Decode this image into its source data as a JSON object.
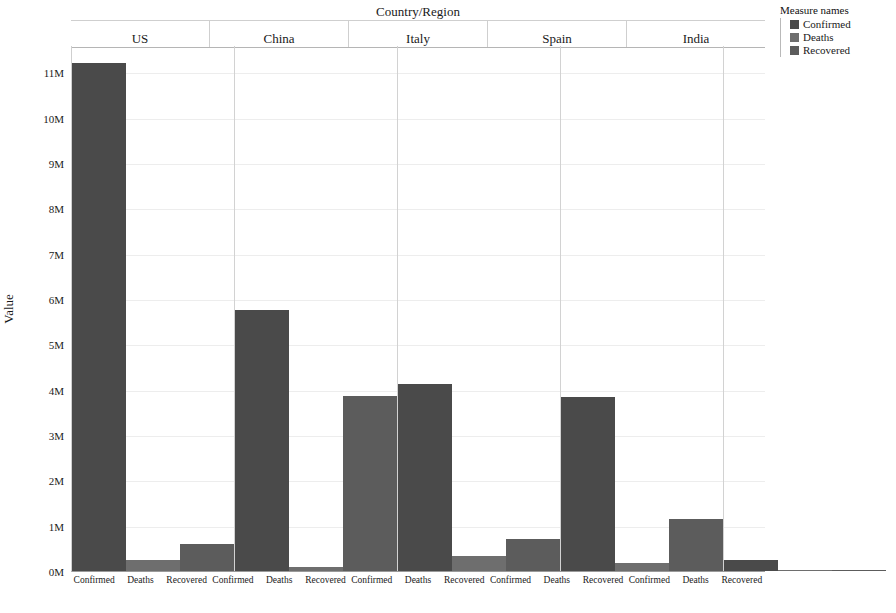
{
  "chart_data": {
    "type": "bar",
    "title": "",
    "xlabel": "Country/Region",
    "ylabel": "Value",
    "ylim": [
      0,
      11600000
    ],
    "grid": true,
    "legend_position": "right",
    "y_ticks": [
      "0M",
      "1M",
      "2M",
      "3M",
      "4M",
      "5M",
      "6M",
      "7M",
      "8M",
      "9M",
      "10M",
      "11M"
    ],
    "y_tick_values": [
      0,
      1000000,
      2000000,
      3000000,
      4000000,
      5000000,
      6000000,
      7000000,
      8000000,
      9000000,
      10000000,
      11000000
    ],
    "categories": [
      "Confirmed",
      "Deaths",
      "Recovered"
    ],
    "panels": [
      {
        "name": "US",
        "values": [
          11200000,
          250000,
          600000
        ],
        "bars": [
          {
            "measure": "Confirmed",
            "value": 11200000,
            "color": "#4a4a4a"
          },
          {
            "measure": "Deaths",
            "value": 250000,
            "color": "#6e6e6e"
          },
          {
            "measure": "Recovered",
            "value": 600000,
            "color": "#5c5c5c"
          }
        ]
      },
      {
        "name": "China",
        "values": [
          5750000,
          90000,
          3850000
        ],
        "bars": [
          {
            "measure": "Confirmed",
            "value": 5750000,
            "color": "#4a4a4a"
          },
          {
            "measure": "Deaths",
            "value": 90000,
            "color": "#6e6e6e"
          },
          {
            "measure": "Recovered",
            "value": 3850000,
            "color": "#5c5c5c"
          }
        ]
      },
      {
        "name": "Italy",
        "values": [
          4120000,
          330000,
          700000
        ],
        "bars": [
          {
            "measure": "Confirmed",
            "value": 4120000,
            "color": "#4a4a4a"
          },
          {
            "measure": "Deaths",
            "value": 330000,
            "color": "#6e6e6e"
          },
          {
            "measure": "Recovered",
            "value": 700000,
            "color": "#5c5c5c"
          }
        ]
      },
      {
        "name": "Spain",
        "values": [
          3830000,
          170000,
          1150000
        ],
        "bars": [
          {
            "measure": "Confirmed",
            "value": 3830000,
            "color": "#4a4a4a"
          },
          {
            "measure": "Deaths",
            "value": 170000,
            "color": "#6e6e6e"
          },
          {
            "measure": "Recovered",
            "value": 1150000,
            "color": "#5c5c5c"
          }
        ]
      },
      {
        "name": "India",
        "values": [
          250000,
          12000,
          20000
        ],
        "bars": [
          {
            "measure": "Confirmed",
            "value": 250000,
            "color": "#4a4a4a"
          },
          {
            "measure": "Deaths",
            "value": 12000,
            "color": "#6e6e6e"
          },
          {
            "measure": "Recovered",
            "value": 20000,
            "color": "#5c5c5c"
          }
        ]
      }
    ],
    "legend": {
      "title": "Measure names",
      "entries": [
        {
          "label": "Confirmed",
          "color": "#4a4a4a"
        },
        {
          "label": "Deaths",
          "color": "#6e6e6e"
        },
        {
          "label": "Recovered",
          "color": "#5c5c5c"
        }
      ]
    }
  }
}
